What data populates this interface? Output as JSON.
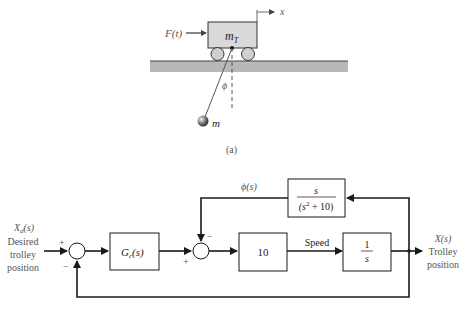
{
  "figure_a": {
    "force_label": "F(t)",
    "trolley_mass_label": "m",
    "trolley_mass_subscript": "T",
    "x_axis_label": "x",
    "angle_label": "ϕ",
    "pendulum_mass_label": "m",
    "caption": "(a)"
  },
  "block_diagram": {
    "input": {
      "symbol": "X",
      "subscript": "d",
      "arg": "(s)",
      "line1": "Desired",
      "line2": "trolley",
      "line3": "position"
    },
    "sum1": {
      "plus": "+",
      "minus": "−"
    },
    "controller": {
      "symbol": "G",
      "subscript": "c",
      "arg": "(s)"
    },
    "sum2": {
      "plus": "+",
      "minus": "−"
    },
    "gain_block": {
      "label": "10"
    },
    "speed_label": "Speed",
    "integrator": {
      "numerator": "1",
      "denominator": "s"
    },
    "feedback_block": {
      "numerator": "s",
      "denominator_pre": "(s",
      "denominator_exp": "2",
      "denominator_post": " + 10)"
    },
    "phi_signal": "ϕ(s)",
    "output": {
      "symbol": "X(s)",
      "line1": "Trolley",
      "line2": "position"
    }
  },
  "colors": {
    "line": "#1a1a1a",
    "ground": "#b8b8b8",
    "trolley_fill": "#d9d9d9",
    "text": "#333333"
  }
}
